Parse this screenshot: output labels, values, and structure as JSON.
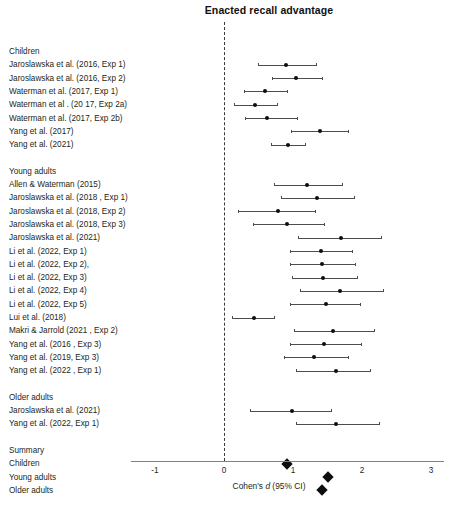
{
  "chart_data": {
    "type": "scatter",
    "plot_style": "forest-plot",
    "title": "Enacted recall advantage",
    "xlabel": "Cohen's d (95% CI)",
    "ylabel": "",
    "xlim": [
      -1.4,
      3.2
    ],
    "xticks": [
      -1,
      0,
      1,
      2,
      3
    ],
    "xtick_labels": [
      "-1",
      "0",
      "1",
      "2",
      "3"
    ],
    "grid": false,
    "reference_line": 0,
    "reference_line_style": "dashed",
    "legend": "none",
    "groups": [
      {
        "name": "Children",
        "studies": [
          {
            "label": "Jaroslawska et al. (2016, Exp 1)",
            "d": 0.9,
            "ci_low": 0.49,
            "ci_high": 1.33
          },
          {
            "label": "Jaroslawska et al. (2016, Exp 2)",
            "d": 1.05,
            "ci_low": 0.7,
            "ci_high": 1.42
          },
          {
            "label": "Waterman et al. (2017, Exp 1)",
            "d": 0.6,
            "ci_low": 0.29,
            "ci_high": 0.92
          },
          {
            "label": "Waterman et al . (20 17, Exp 2a)",
            "d": 0.45,
            "ci_low": 0.15,
            "ci_high": 0.77
          },
          {
            "label": "Waterman et al. (2017, Exp 2b)",
            "d": 0.62,
            "ci_low": 0.3,
            "ci_high": 1.06
          },
          {
            "label": "Yang et al. (2017)",
            "d": 1.39,
            "ci_low": 0.97,
            "ci_high": 1.8
          },
          {
            "label": "Yang et al. (2021)",
            "d": 0.93,
            "ci_low": 0.68,
            "ci_high": 1.17
          }
        ]
      },
      {
        "name": "Young adults",
        "studies": [
          {
            "label": "Allen & Waterman (2015)",
            "d": 1.2,
            "ci_low": 0.72,
            "ci_high": 1.71
          },
          {
            "label": "Jaroslawska et al. (2018 , Exp 1)",
            "d": 1.35,
            "ci_low": 0.83,
            "ci_high": 1.88
          },
          {
            "label": "Jaroslawska et al. (2018, Exp 2)",
            "d": 0.78,
            "ci_low": 0.2,
            "ci_high": 1.32
          },
          {
            "label": "Jaroslawska et al. (2018, Exp 3)",
            "d": 0.92,
            "ci_low": 0.42,
            "ci_high": 1.45
          },
          {
            "label": "Jaroslawska et al. (2021)",
            "d": 1.7,
            "ci_low": 1.07,
            "ci_high": 2.28
          },
          {
            "label": "Li et al. (2022, Exp 1)",
            "d": 1.4,
            "ci_low": 0.95,
            "ci_high": 1.85
          },
          {
            "label": "Li et al. (2022, Exp 2),",
            "d": 1.42,
            "ci_low": 0.95,
            "ci_high": 1.9
          },
          {
            "label": "Li et al. (2022, Exp 3)",
            "d": 1.43,
            "ci_low": 0.98,
            "ci_high": 1.93
          },
          {
            "label": "Li et al. (2022, Exp 4)",
            "d": 1.68,
            "ci_low": 1.1,
            "ci_high": 2.3
          },
          {
            "label": "Li et al. (2022, Exp 5)",
            "d": 1.48,
            "ci_low": 0.95,
            "ci_high": 1.97
          },
          {
            "label": "Lui et al. (2018)",
            "d": 0.43,
            "ci_low": 0.12,
            "ci_high": 0.72
          },
          {
            "label": "Makri & Jarrold (2021 , Exp 2)",
            "d": 1.58,
            "ci_low": 1.02,
            "ci_high": 2.18
          },
          {
            "label": "Yang et al. (2016 , Exp 3)",
            "d": 1.45,
            "ci_low": 0.95,
            "ci_high": 1.98
          },
          {
            "label": "Yang et al. (2019, Exp 3)",
            "d": 1.3,
            "ci_low": 0.87,
            "ci_high": 1.8
          },
          {
            "label": "Yang et al. (2022 , Exp 1)",
            "d": 1.62,
            "ci_low": 1.05,
            "ci_high": 2.12
          }
        ]
      },
      {
        "name": "Older adults",
        "studies": [
          {
            "label": "Jaroslawska et al. (2021)",
            "d": 0.98,
            "ci_low": 0.38,
            "ci_high": 1.55
          },
          {
            "label": "Yang et al. (2022, Exp 1)",
            "d": 1.63,
            "ci_low": 1.05,
            "ci_high": 2.25
          }
        ]
      }
    ],
    "summary": {
      "name": "Summary",
      "items": [
        {
          "label": "Children",
          "d": 0.91
        },
        {
          "label": "Young adults",
          "d": 1.5
        },
        {
          "label": "Older adults",
          "d": 1.42
        }
      ]
    }
  },
  "colors": {
    "point": "#0d0d0d",
    "line": "#4d4d4d",
    "axis": "#808080",
    "text": "#231f20",
    "zero_line": "#3a3a3a"
  },
  "caption": ""
}
